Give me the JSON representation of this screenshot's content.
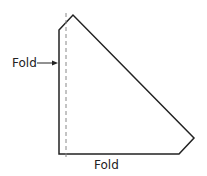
{
  "diagram": {
    "type": "net-fold-diagram",
    "colors": {
      "outline": "#222222",
      "fold_line": "#888888",
      "text": "#222222",
      "background": "#ffffff"
    },
    "shape": {
      "points": [
        [
          59,
          30
        ],
        [
          73,
          15
        ],
        [
          194,
          138
        ],
        [
          179,
          154
        ],
        [
          59,
          154
        ]
      ]
    },
    "fold_line": {
      "x": 66,
      "y1": 13,
      "y2": 158
    },
    "labels": {
      "left_fold": "Fold",
      "bottom_fold": "Fold"
    }
  }
}
